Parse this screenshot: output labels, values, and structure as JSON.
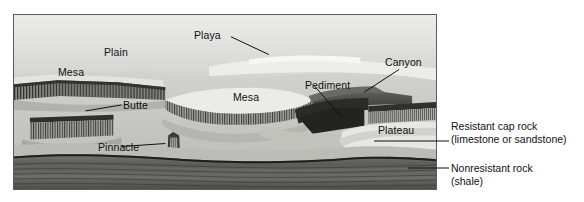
{
  "figure": {
    "type": "geomorphology-block-diagram",
    "panel": {
      "border_color": "#5c5c5c",
      "sky_color": "#d9d9d7",
      "plain_color": "#c9c9c5",
      "highlight_color": "#efefec",
      "cliff_color": "#4a4a48",
      "strata_color": "#6f6f6d",
      "strata_dark_color": "#454543"
    },
    "labels": [
      {
        "id": "plain",
        "text": "Plain",
        "x": 104,
        "y": 46,
        "leader": false
      },
      {
        "id": "mesa-left",
        "text": "Mesa",
        "x": 58,
        "y": 66,
        "leader": false
      },
      {
        "id": "playa",
        "text": "Playa",
        "x": 194,
        "y": 34,
        "leader": true
      },
      {
        "id": "butte",
        "text": "Butte",
        "x": 123,
        "y": 102,
        "leader": true
      },
      {
        "id": "pinnacle",
        "text": "Pinnacle",
        "x": 98,
        "y": 142,
        "leader": true
      },
      {
        "id": "mesa-mid",
        "text": "Mesa",
        "x": 233,
        "y": 94,
        "leader": false
      },
      {
        "id": "pediment",
        "text": "Pediment",
        "x": 305,
        "y": 78,
        "leader": true
      },
      {
        "id": "canyon",
        "text": "Canyon",
        "x": 385,
        "y": 58,
        "leader": true
      },
      {
        "id": "plateau",
        "text": "Plateau",
        "x": 378,
        "y": 127,
        "leader": false
      }
    ],
    "key_items": [
      {
        "id": "resistant-cap-rock",
        "line1": "Resistant cap rock",
        "line2": "(limestone or sandstone)",
        "x": 451,
        "y": 120
      },
      {
        "id": "nonresistant-rock",
        "line1": "Nonresistant rock",
        "line2": "(shale)",
        "x": 451,
        "y": 163
      }
    ]
  }
}
